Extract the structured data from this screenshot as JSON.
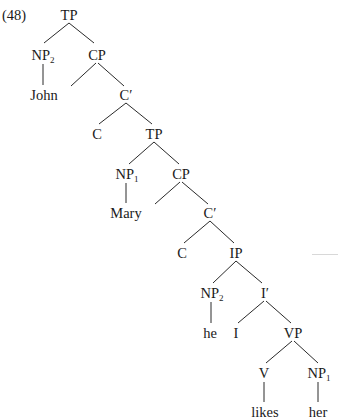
{
  "example": {
    "number": "(48)",
    "top_fragment": "(a)   Mary₁ said that he₂ likes her₁ (cut off)"
  },
  "tree": {
    "nodes": [
      {
        "id": "tp1",
        "label": "TP",
        "sub": "",
        "x": 69,
        "y": 15
      },
      {
        "id": "np2a",
        "label": "NP",
        "sub": "2",
        "x": 43,
        "y": 55
      },
      {
        "id": "cp1",
        "label": "CP",
        "sub": "",
        "x": 97,
        "y": 55
      },
      {
        "id": "john",
        "label": "John",
        "sub": "",
        "x": 44,
        "y": 95
      },
      {
        "id": "cbar1",
        "label": "C′",
        "sub": "",
        "x": 126,
        "y": 95
      },
      {
        "id": "c1",
        "label": "C",
        "sub": "",
        "x": 97,
        "y": 134
      },
      {
        "id": "tp2",
        "label": "TP",
        "sub": "",
        "x": 154,
        "y": 134
      },
      {
        "id": "np1a",
        "label": "NP",
        "sub": "1",
        "x": 127,
        "y": 174
      },
      {
        "id": "cp2",
        "label": "CP",
        "sub": "",
        "x": 181,
        "y": 174
      },
      {
        "id": "mary",
        "label": "Mary",
        "sub": "",
        "x": 126,
        "y": 213
      },
      {
        "id": "cbar2",
        "label": "C′",
        "sub": "",
        "x": 210,
        "y": 213
      },
      {
        "id": "c2",
        "label": "C",
        "sub": "",
        "x": 182,
        "y": 253
      },
      {
        "id": "ip",
        "label": "IP",
        "sub": "",
        "x": 236,
        "y": 253
      },
      {
        "id": "np2b",
        "label": "NP",
        "sub": "2",
        "x": 212,
        "y": 293
      },
      {
        "id": "ibar",
        "label": "I′",
        "sub": "",
        "x": 265,
        "y": 293
      },
      {
        "id": "he",
        "label": "he",
        "sub": "",
        "x": 210,
        "y": 333
      },
      {
        "id": "i",
        "label": "I",
        "sub": "",
        "x": 236,
        "y": 333
      },
      {
        "id": "vp",
        "label": "VP",
        "sub": "",
        "x": 293,
        "y": 333
      },
      {
        "id": "v",
        "label": "V",
        "sub": "",
        "x": 264,
        "y": 373
      },
      {
        "id": "np1b",
        "label": "NP",
        "sub": "1",
        "x": 319,
        "y": 373
      },
      {
        "id": "likes",
        "label": "likes",
        "sub": "",
        "x": 265,
        "y": 412
      },
      {
        "id": "her",
        "label": "her",
        "sub": "",
        "x": 318,
        "y": 412
      }
    ],
    "edges": [
      {
        "from": "tp1",
        "to": "np2a",
        "x1": 69,
        "y1": 23,
        "x2": 44,
        "y2": 43
      },
      {
        "from": "tp1",
        "to": "cp1",
        "x1": 69,
        "y1": 23,
        "x2": 94,
        "y2": 43
      },
      {
        "from": "np2a",
        "to": "john",
        "x1": 43,
        "y1": 64,
        "x2": 43,
        "y2": 85
      },
      {
        "from": "cp1",
        "to": "spec-cp1-empty",
        "x1": 96,
        "y1": 63,
        "x2": 71,
        "y2": 86
      },
      {
        "from": "cp1",
        "to": "cbar1",
        "x1": 98,
        "y1": 63,
        "x2": 124,
        "y2": 86
      },
      {
        "from": "cbar1",
        "to": "c1",
        "x1": 126,
        "y1": 103,
        "x2": 99,
        "y2": 124
      },
      {
        "from": "cbar1",
        "to": "tp2",
        "x1": 126,
        "y1": 103,
        "x2": 152,
        "y2": 124
      },
      {
        "from": "tp2",
        "to": "np1a",
        "x1": 154,
        "y1": 142,
        "x2": 129,
        "y2": 164
      },
      {
        "from": "tp2",
        "to": "cp2",
        "x1": 154,
        "y1": 142,
        "x2": 179,
        "y2": 164
      },
      {
        "from": "np1a",
        "to": "mary",
        "x1": 126,
        "y1": 183,
        "x2": 126,
        "y2": 203
      },
      {
        "from": "cp2",
        "to": "spec-cp2-empty",
        "x1": 180,
        "y1": 182,
        "x2": 155,
        "y2": 204
      },
      {
        "from": "cp2",
        "to": "cbar2",
        "x1": 182,
        "y1": 182,
        "x2": 208,
        "y2": 204
      },
      {
        "from": "cbar2",
        "to": "c2",
        "x1": 210,
        "y1": 221,
        "x2": 184,
        "y2": 243
      },
      {
        "from": "cbar2",
        "to": "ip",
        "x1": 210,
        "y1": 221,
        "x2": 234,
        "y2": 243
      },
      {
        "from": "ip",
        "to": "np2b",
        "x1": 236,
        "y1": 261,
        "x2": 213,
        "y2": 283
      },
      {
        "from": "ip",
        "to": "ibar",
        "x1": 236,
        "y1": 261,
        "x2": 262,
        "y2": 283
      },
      {
        "from": "np2b",
        "to": "he",
        "x1": 211,
        "y1": 302,
        "x2": 211,
        "y2": 323
      },
      {
        "from": "ibar",
        "to": "i",
        "x1": 264,
        "y1": 301,
        "x2": 238,
        "y2": 323
      },
      {
        "from": "ibar",
        "to": "vp",
        "x1": 266,
        "y1": 301,
        "x2": 291,
        "y2": 323
      },
      {
        "from": "vp",
        "to": "v",
        "x1": 292,
        "y1": 341,
        "x2": 266,
        "y2": 363
      },
      {
        "from": "vp",
        "to": "np1b",
        "x1": 294,
        "y1": 341,
        "x2": 318,
        "y2": 363
      },
      {
        "from": "v",
        "to": "likes",
        "x1": 264,
        "y1": 382,
        "x2": 264,
        "y2": 402
      },
      {
        "from": "np1b",
        "to": "her",
        "x1": 318,
        "y1": 382,
        "x2": 318,
        "y2": 402
      }
    ]
  },
  "colors": {
    "ink": "#1a1a1a",
    "line": "#2a2a2a",
    "background": "#ffffff"
  }
}
